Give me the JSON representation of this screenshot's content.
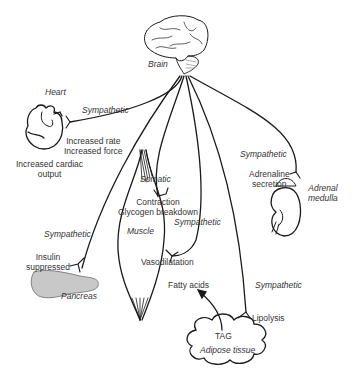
{
  "diagram": {
    "source_node": {
      "label": "Brain"
    },
    "organs": {
      "heart": {
        "label": "Heart",
        "nerve": "Sympathetic",
        "effects": [
          "Increased rate",
          "Increased force"
        ],
        "outcome_line1": "Increased cardiac",
        "outcome_line2": "output"
      },
      "adrenal": {
        "label_line1": "Adrenal",
        "label_line2": "medulla",
        "nerve": "Sympathetic",
        "effect_line1": "Adrenaline",
        "effect_line2": "secretion"
      },
      "muscle": {
        "label": "Muscle",
        "nerve_somatic": "Somatic",
        "effect_somatic_line1": "Contraction",
        "effect_somatic_line2": "Glycogen breakdown",
        "nerve_sympathetic": "Sympathetic",
        "effect_sympathetic": "Vasodilatation"
      },
      "pancreas": {
        "label": "Pancreas",
        "nerve": "Sympathetic",
        "effect_line1": "Insulin",
        "effect_line2": "suppressed"
      },
      "adipose": {
        "label": "Adipose tissue",
        "content": "TAG",
        "nerve": "Sympathetic",
        "effect": "Lipolysis",
        "product": "Fatty acids"
      }
    },
    "colors": {
      "line": "#1a1a1a",
      "text": "#333333",
      "background": "#ffffff",
      "pancreas_fill": "#c8c8c8"
    }
  }
}
